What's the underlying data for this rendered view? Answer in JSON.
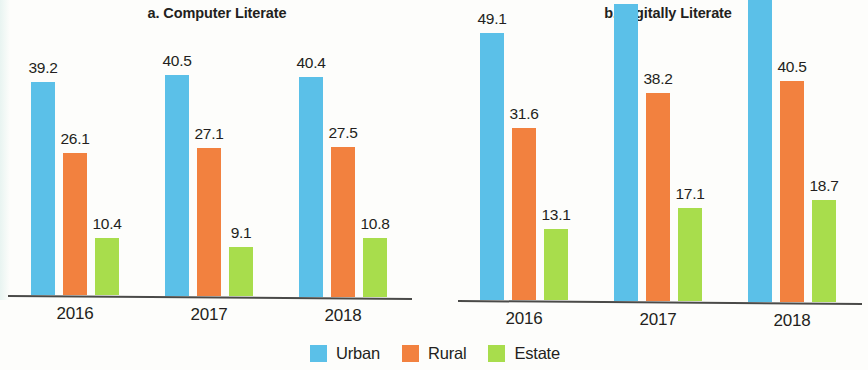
{
  "charts": [
    {
      "id": "computer-literate",
      "title": "a. Computer Literate",
      "categories": [
        "2016",
        "2017",
        "2018"
      ],
      "series": [
        {
          "name": "Urban",
          "key": "urban",
          "color": "#5bc0e8",
          "values": [
            39.2,
            40.5,
            40.4
          ]
        },
        {
          "name": "Rural",
          "key": "rural",
          "color": "#f2813f",
          "values": [
            26.1,
            27.1,
            27.5
          ]
        },
        {
          "name": "Estate",
          "key": "estate",
          "color": "#a8dd4c",
          "values": [
            10.4,
            9.1,
            10.8
          ]
        }
      ],
      "labels": [
        [
          "39.2",
          "26.1",
          "10.4"
        ],
        [
          "40.5",
          "27.1",
          "9.1"
        ],
        [
          "40.4",
          "27.5",
          "10.8"
        ]
      ]
    },
    {
      "id": "digitally-literate",
      "title": "b. Digitally Literate",
      "categories": [
        "2016",
        "2017",
        "2018"
      ],
      "series": [
        {
          "name": "Urban",
          "key": "urban",
          "color": "#5bc0e8",
          "values": [
            49.1,
            54.6,
            56.6
          ]
        },
        {
          "name": "Rural",
          "key": "rural",
          "color": "#f2813f",
          "values": [
            31.6,
            38.2,
            40.5
          ]
        },
        {
          "name": "Estate",
          "key": "estate",
          "color": "#a8dd4c",
          "values": [
            13.1,
            17.1,
            18.7
          ]
        }
      ],
      "labels": [
        [
          "49.1",
          "31.6",
          "13.1"
        ],
        [
          "54.6",
          "38.2",
          "17.1"
        ],
        [
          "56.6",
          "40.5",
          "18.7"
        ]
      ]
    }
  ],
  "legend": {
    "items": [
      {
        "label": "Urban",
        "key": "urban",
        "color": "#5bc0e8"
      },
      {
        "label": "Rural",
        "key": "rural",
        "color": "#f2813f"
      },
      {
        "label": "Estate",
        "key": "estate",
        "color": "#a8dd4c"
      }
    ]
  },
  "chart_data": {
    "type": "bar",
    "panels": [
      {
        "title": "a. Computer Literate",
        "categories": [
          "2016",
          "2017",
          "2018"
        ],
        "series": [
          {
            "name": "Urban",
            "values": [
              39.2,
              40.5,
              40.4
            ]
          },
          {
            "name": "Rural",
            "values": [
              26.1,
              27.1,
              27.5
            ]
          },
          {
            "name": "Estate",
            "values": [
              10.4,
              9.1,
              10.8
            ]
          }
        ],
        "xlabel": "",
        "ylabel": "",
        "ylim": [
          0,
          60
        ],
        "grid": false,
        "data_labels": true
      },
      {
        "title": "b. Digitally Literate",
        "categories": [
          "2016",
          "2017",
          "2018"
        ],
        "series": [
          {
            "name": "Urban",
            "values": [
              49.1,
              54.6,
              56.6
            ]
          },
          {
            "name": "Rural",
            "values": [
              31.6,
              38.2,
              40.5
            ]
          },
          {
            "name": "Estate",
            "values": [
              13.1,
              17.1,
              18.7
            ]
          }
        ],
        "xlabel": "",
        "ylabel": "",
        "ylim": [
          0,
          60
        ],
        "grid": false,
        "data_labels": true
      }
    ],
    "legend": [
      "Urban",
      "Rural",
      "Estate"
    ],
    "legend_position": "bottom-center",
    "colors": {
      "Urban": "#5bc0e8",
      "Rural": "#f2813f",
      "Estate": "#a8dd4c"
    }
  }
}
